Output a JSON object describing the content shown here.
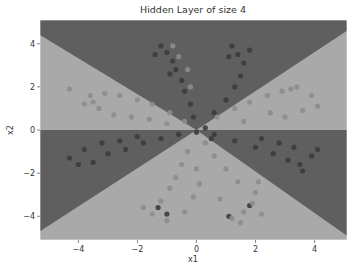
{
  "chart_data": {
    "type": "scatter",
    "title": "Hidden Layer of size 4",
    "xlabel": "x1",
    "ylabel": "x2",
    "xlim": [
      -5.3,
      5.1
    ],
    "ylim": [
      -5.1,
      5.1
    ],
    "xticks": [
      -4,
      -2,
      0,
      2,
      4
    ],
    "yticks": [
      -4,
      -2,
      0,
      2,
      4
    ],
    "xtick_labels": [
      "−4",
      "−2",
      "0",
      "2",
      "4"
    ],
    "ytick_labels": [
      "−4",
      "−2",
      "0",
      "2",
      "4"
    ],
    "grid": false,
    "legend": null,
    "background": {
      "description": "Decision boundary contour of a neural network with 4 hidden units; regions split by lines through the origin",
      "class_0_color": "#5f5f5f",
      "class_1_color": "#a9a9a9",
      "regions": [
        {
          "name": "top-wedge",
          "class": 0
        },
        {
          "name": "upper-left",
          "class": 1
        },
        {
          "name": "upper-right",
          "class": 1
        },
        {
          "name": "lower-left",
          "class": 0
        },
        {
          "name": "lower-right",
          "class": 0
        },
        {
          "name": "bottom-wedge",
          "class": 1
        }
      ],
      "boundaries": [
        {
          "from": [
            0,
            0
          ],
          "to": [
            -5.3,
            4.4
          ]
        },
        {
          "from": [
            0,
            0
          ],
          "to": [
            5.1,
            4.6
          ]
        },
        {
          "from": [
            -5.3,
            0
          ],
          "to": [
            5.1,
            0
          ]
        },
        {
          "from": [
            0,
            0
          ],
          "to": [
            -5.3,
            -4.7
          ]
        },
        {
          "from": [
            0,
            0
          ],
          "to": [
            5.1,
            -4.9
          ]
        }
      ]
    },
    "series": [
      {
        "name": "class 0 (dark points)",
        "color": "#3c3c3c",
        "points": [
          [
            -1.0,
            3.6
          ],
          [
            -0.8,
            3.2
          ],
          [
            -0.7,
            2.8
          ],
          [
            -0.5,
            2.3
          ],
          [
            -0.4,
            1.8
          ],
          [
            -0.2,
            1.2
          ],
          [
            -0.1,
            0.6
          ],
          [
            -1.2,
            3.9
          ],
          [
            -1.4,
            3.5
          ],
          [
            -0.9,
            2.6
          ],
          [
            1.2,
            3.9
          ],
          [
            1.4,
            3.5
          ],
          [
            1.6,
            3.1
          ],
          [
            1.5,
            2.5
          ],
          [
            1.3,
            2.0
          ],
          [
            1.0,
            1.4
          ],
          [
            0.6,
            0.8
          ],
          [
            1.8,
            3.7
          ],
          [
            1.1,
            3.4
          ],
          [
            -4.3,
            -1.3
          ],
          [
            -3.5,
            -1.5
          ],
          [
            -3.0,
            -1.1
          ],
          [
            -2.4,
            -0.9
          ],
          [
            -1.8,
            -0.6
          ],
          [
            -1.2,
            -0.4
          ],
          [
            -0.6,
            -0.2
          ],
          [
            -3.8,
            -0.9
          ],
          [
            -3.2,
            -0.6
          ],
          [
            -2.6,
            -0.5
          ],
          [
            -2.0,
            -0.3
          ],
          [
            -4.0,
            -1.6
          ],
          [
            3.9,
            -1.2
          ],
          [
            3.5,
            -1.6
          ],
          [
            3.1,
            -1.4
          ],
          [
            2.6,
            -1.1
          ],
          [
            2.0,
            -0.8
          ],
          [
            1.3,
            -0.5
          ],
          [
            0.6,
            -0.2
          ],
          [
            3.3,
            -0.8
          ],
          [
            2.8,
            -0.6
          ],
          [
            2.2,
            -0.4
          ],
          [
            4.1,
            -0.9
          ],
          [
            3.6,
            -1.9
          ],
          [
            -1.0,
            -3.9
          ],
          [
            -1.3,
            -3.6
          ],
          [
            1.1,
            -4.0
          ],
          [
            1.8,
            -3.5
          ],
          [
            0.5,
            -0.4
          ],
          [
            0.0,
            -0.1
          ],
          [
            0.3,
            0.1
          ]
        ]
      },
      {
        "name": "class 1 (light points)",
        "color": "#8c8c8c",
        "points": [
          [
            -4.3,
            1.9
          ],
          [
            -3.6,
            1.6
          ],
          [
            -3.1,
            1.7
          ],
          [
            -2.6,
            1.6
          ],
          [
            -2.0,
            1.4
          ],
          [
            -1.5,
            1.2
          ],
          [
            -0.9,
            0.8
          ],
          [
            -0.4,
            0.4
          ],
          [
            -3.8,
            1.2
          ],
          [
            -3.3,
            1.0
          ],
          [
            -2.8,
            0.7
          ],
          [
            -2.2,
            0.6
          ],
          [
            -1.6,
            0.5
          ],
          [
            -1.0,
            0.3
          ],
          [
            -3.5,
            1.3
          ],
          [
            3.9,
            1.6
          ],
          [
            3.4,
            2.0
          ],
          [
            2.9,
            1.8
          ],
          [
            2.4,
            1.6
          ],
          [
            1.8,
            1.3
          ],
          [
            1.3,
            1.0
          ],
          [
            0.7,
            0.6
          ],
          [
            4.1,
            1.1
          ],
          [
            3.6,
            0.9
          ],
          [
            3.0,
            0.6
          ],
          [
            2.5,
            0.8
          ],
          [
            1.6,
            0.4
          ],
          [
            3.2,
            1.9
          ],
          [
            -0.8,
            3.9
          ],
          [
            -0.6,
            3.4
          ],
          [
            -0.3,
            2.8
          ],
          [
            -0.2,
            2.0
          ],
          [
            -1.5,
            -3.9
          ],
          [
            -1.2,
            -3.3
          ],
          [
            -0.9,
            -2.7
          ],
          [
            -0.7,
            -2.2
          ],
          [
            -0.5,
            -1.6
          ],
          [
            -0.3,
            -1.0
          ],
          [
            -1.8,
            -3.6
          ],
          [
            -1.0,
            -4.2
          ],
          [
            -0.4,
            -3.8
          ],
          [
            -0.1,
            -3.1
          ],
          [
            0.1,
            -2.5
          ],
          [
            0.0,
            -1.8
          ],
          [
            1.2,
            -4.1
          ],
          [
            1.6,
            -3.8
          ],
          [
            1.9,
            -3.4
          ],
          [
            2.0,
            -2.9
          ],
          [
            1.4,
            -2.4
          ],
          [
            1.0,
            -1.8
          ],
          [
            0.6,
            -1.2
          ],
          [
            0.3,
            -0.6
          ],
          [
            2.2,
            -3.9
          ],
          [
            1.5,
            -4.3
          ],
          [
            2.1,
            -2.4
          ],
          [
            0.8,
            -3.2
          ]
        ]
      }
    ]
  }
}
